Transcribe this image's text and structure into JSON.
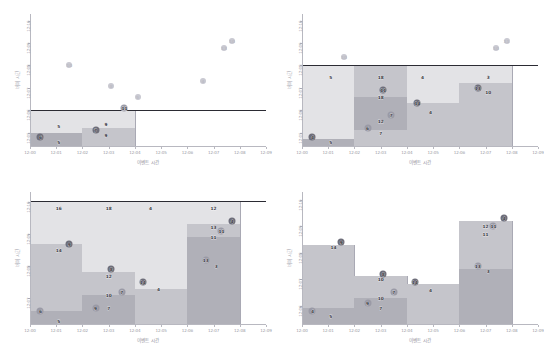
{
  "figure": {
    "width": 544,
    "height": 358,
    "background": "#ffffff",
    "layout": "2x2 grid of time-vs-time scatter/window charts"
  },
  "common": {
    "xlabel": "이벤트 시간",
    "ylabel": "버퍼 시간",
    "xticklabels": [
      "12:00",
      "12:01",
      "12:02",
      "12:03",
      "12:04",
      "12:05",
      "12:06",
      "12:07",
      "12:08",
      "12:09"
    ],
    "xlim": [
      "12:00",
      "12:09"
    ],
    "axis_color": "#b8b8c0",
    "tick_label_color": "#9a9aa4",
    "axis_label_color": "#9b9ba6",
    "watermark_color": "#2b2b33",
    "marker_dark": "#6e6e7a",
    "marker_mid": "#9a9aa6",
    "marker_light": "#c9c9d1",
    "window_light": "#e3e3e6",
    "window_mid": "#c5c5cb",
    "window_dark": "#b0b0b8"
  },
  "chart_data": [
    {
      "id": "top-left",
      "type": "scatter",
      "title": "",
      "xlabel": "이벤트 시간",
      "ylabel": "버퍼 시간",
      "xticklabels": [
        "12:00",
        "12:01",
        "12:02",
        "12:03",
        "12:04",
        "12:05",
        "12:06",
        "12:07",
        "12:08",
        "12:09"
      ],
      "yticklabels": [
        "12:05",
        "12:06",
        "12:07",
        "12:08",
        "12:09",
        "12:10"
      ],
      "ylim": [
        "12:04.4",
        "12:10.3"
      ],
      "grid": false,
      "legend": false,
      "watermark": {
        "y": "12:06",
        "label": "",
        "color": "#2b2b33"
      },
      "points": [
        {
          "label": "6",
          "x": "12:00.4",
          "y": "12:04.8",
          "shade": "dark"
        },
        {
          "label": "5",
          "x": "12:01.1",
          "y": "12:05.3",
          "shade": "none"
        },
        {
          "label": "10",
          "x": "12:01.5",
          "y": "12:08.0",
          "shade": "light"
        },
        {
          "label": "7",
          "x": "12:02.5",
          "y": "12:05.1",
          "shade": "dark"
        },
        {
          "label": "9",
          "x": "12:02.9",
          "y": "12:05.4",
          "shade": "none"
        },
        {
          "label": "9",
          "x": "12:02.9",
          "y": "12:04.9",
          "shade": "none"
        },
        {
          "label": "8",
          "x": "12:03.1",
          "y": "12:07.1",
          "shade": "light"
        },
        {
          "label": "11",
          "x": "12:03.6",
          "y": "12:06.1",
          "shade": "mid"
        },
        {
          "label": "5",
          "x": "12:04.1",
          "y": "12:06.6",
          "shade": "light"
        },
        {
          "label": "5",
          "x": "12:01.1",
          "y": "12:04.6",
          "shade": "none"
        },
        {
          "label": "4",
          "x": "12:06.6",
          "y": "12:07.3",
          "shade": "light"
        },
        {
          "label": "13",
          "x": "12:07.4",
          "y": "12:08.8",
          "shade": "light"
        },
        {
          "label": "10",
          "x": "12:07.7",
          "y": "12:09.1",
          "shade": "light"
        }
      ],
      "windows": [
        {
          "x0": "12:00",
          "x1": "12:02",
          "y0": "12:04.4",
          "y1": "12:06",
          "bands": [
            {
              "from": "12:05.0",
              "to": "12:06",
              "fill": "window_light"
            },
            {
              "from": "12:04.4",
              "to": "12:05.0",
              "fill": "window_dark"
            }
          ]
        },
        {
          "x0": "12:02",
          "x1": "12:04",
          "y0": "12:04.4",
          "y1": "12:06",
          "bands": [
            {
              "from": "12:05.2",
              "to": "12:06",
              "fill": "window_light"
            },
            {
              "from": "12:04.4",
              "to": "12:05.2",
              "fill": "window_mid"
            }
          ]
        }
      ]
    },
    {
      "id": "top-right",
      "type": "scatter",
      "title": "",
      "xlabel": "이벤트 시간",
      "ylabel": "버퍼 시간",
      "xticklabels": [
        "12:00",
        "12:01",
        "12:02",
        "12:03",
        "12:04",
        "12:05",
        "12:06",
        "12:07",
        "12:08",
        "12:09"
      ],
      "yticklabels": [
        "12:05",
        "12:06",
        "12:07",
        "12:08",
        "12:09",
        "12:10"
      ],
      "ylim": [
        "12:04.4",
        "12:10.3"
      ],
      "grid": false,
      "legend": false,
      "watermark": {
        "y": "12:08",
        "label": "",
        "color": "#2b2b33"
      },
      "points": [
        {
          "label": "4",
          "x": "12:00.4",
          "y": "12:04.8",
          "shade": "dark"
        },
        {
          "label": "5",
          "x": "12:01.1",
          "y": "12:04.6",
          "shade": "none"
        },
        {
          "label": "5",
          "x": "12:01.1",
          "y": "12:07.5",
          "shade": "none"
        },
        {
          "label": "10",
          "x": "12:01.6",
          "y": "12:08.4",
          "shade": "light"
        },
        {
          "label": "18",
          "x": "12:03.0",
          "y": "12:07.5",
          "shade": "none"
        },
        {
          "label": "11",
          "x": "12:03.1",
          "y": "12:06.9",
          "shade": "dark"
        },
        {
          "label": "18",
          "x": "12:03.0",
          "y": "12:06.6",
          "shade": "none"
        },
        {
          "label": "12",
          "x": "12:03.0",
          "y": "12:05.5",
          "shade": "none"
        },
        {
          "label": "7",
          "x": "12:03.4",
          "y": "12:05.8",
          "shade": "mid"
        },
        {
          "label": "7",
          "x": "12:03.0",
          "y": "12:05.0",
          "shade": "none"
        },
        {
          "label": "6",
          "x": "12:02.5",
          "y": "12:05.2",
          "shade": "mid"
        },
        {
          "label": "4",
          "x": "12:04.6",
          "y": "12:07.5",
          "shade": "none"
        },
        {
          "label": "14",
          "x": "12:04.4",
          "y": "12:06.3",
          "shade": "dark"
        },
        {
          "label": "4",
          "x": "12:04.9",
          "y": "12:05.9",
          "shade": "none"
        },
        {
          "label": "3",
          "x": "12:07.1",
          "y": "12:07.5",
          "shade": "none"
        },
        {
          "label": "13",
          "x": "12:06.7",
          "y": "12:07.0",
          "shade": "dark"
        },
        {
          "label": "10",
          "x": "12:07.1",
          "y": "12:06.8",
          "shade": "none"
        },
        {
          "label": "10",
          "x": "12:07.4",
          "y": "12:08.8",
          "shade": "light"
        },
        {
          "label": "11",
          "x": "12:07.8",
          "y": "12:09.1",
          "shade": "light"
        }
      ],
      "windows": [
        {
          "x0": "12:00",
          "x1": "12:02",
          "y0": "12:04.4",
          "y1": "12:08",
          "bands": [
            {
              "from": "12:04.7",
              "to": "12:08",
              "fill": "window_light"
            },
            {
              "from": "12:04.4",
              "to": "12:04.7",
              "fill": "window_dark"
            }
          ]
        },
        {
          "x0": "12:02",
          "x1": "12:04",
          "y0": "12:04.4",
          "y1": "12:08",
          "bands": [
            {
              "from": "12:06.6",
              "to": "12:08",
              "fill": "window_mid"
            },
            {
              "from": "12:05.1",
              "to": "12:06.6",
              "fill": "window_dark"
            },
            {
              "from": "12:04.4",
              "to": "12:05.1",
              "fill": "window_mid"
            }
          ]
        },
        {
          "x0": "12:04",
          "x1": "12:06",
          "y0": "12:04.4",
          "y1": "12:08",
          "bands": [
            {
              "from": "12:06.3",
              "to": "12:08",
              "fill": "window_light"
            },
            {
              "from": "12:04.4",
              "to": "12:06.3",
              "fill": "window_mid"
            }
          ]
        },
        {
          "x0": "12:06",
          "x1": "12:08",
          "y0": "12:04.4",
          "y1": "12:08",
          "bands": [
            {
              "from": "12:07.2",
              "to": "12:08",
              "fill": "window_light"
            },
            {
              "from": "12:04.4",
              "to": "12:07.2",
              "fill": "window_mid"
            }
          ]
        }
      ]
    },
    {
      "id": "bottom-left",
      "type": "scatter",
      "title": "",
      "xlabel": "이벤트 시간",
      "ylabel": "버퍼 시간",
      "xticklabels": [
        "12:00",
        "12:01",
        "12:02",
        "12:03",
        "12:04",
        "12:05",
        "12:06",
        "12:07",
        "12:08",
        "12:09"
      ],
      "yticklabels": [
        "12:07",
        "12:08",
        "12:09",
        "12:10"
      ],
      "ylim": [
        "12:06.2",
        "12:10.3"
      ],
      "grid": false,
      "legend": false,
      "watermark": {
        "y": "12:10",
        "label": "",
        "color": "#2b2b33"
      },
      "points": [
        {
          "label": "6",
          "x": "12:00.4",
          "y": "12:06.6",
          "shade": "mid"
        },
        {
          "label": "5",
          "x": "12:01.1",
          "y": "12:06.3",
          "shade": "none"
        },
        {
          "label": "16",
          "x": "12:01.1",
          "y": "12:09.8",
          "shade": "none"
        },
        {
          "label": "14",
          "x": "12:01.1",
          "y": "12:08.5",
          "shade": "none"
        },
        {
          "label": "9",
          "x": "12:01.5",
          "y": "12:08.7",
          "shade": "dark"
        },
        {
          "label": "18",
          "x": "12:03.0",
          "y": "12:09.8",
          "shade": "none"
        },
        {
          "label": "8",
          "x": "12:03.1",
          "y": "12:07.9",
          "shade": "dark"
        },
        {
          "label": "12",
          "x": "12:03.0",
          "y": "12:07.7",
          "shade": "none"
        },
        {
          "label": "10",
          "x": "12:03.0",
          "y": "12:07.1",
          "shade": "none"
        },
        {
          "label": "7",
          "x": "12:03.0",
          "y": "12:06.7",
          "shade": "none"
        },
        {
          "label": "9",
          "x": "12:02.5",
          "y": "12:06.7",
          "shade": "mid"
        },
        {
          "label": "7",
          "x": "12:03.5",
          "y": "12:07.2",
          "shade": "mid"
        },
        {
          "label": "4",
          "x": "12:04.6",
          "y": "12:09.8",
          "shade": "none"
        },
        {
          "label": "14",
          "x": "12:04.3",
          "y": "12:07.5",
          "shade": "dark"
        },
        {
          "label": "4",
          "x": "12:04.9",
          "y": "12:07.3",
          "shade": "none"
        },
        {
          "label": "12",
          "x": "12:07.0",
          "y": "12:09.8",
          "shade": "none"
        },
        {
          "label": "13",
          "x": "12:07.0",
          "y": "12:09.2",
          "shade": "none"
        },
        {
          "label": "11",
          "x": "12:07.0",
          "y": "12:08.9",
          "shade": "none"
        },
        {
          "label": "11",
          "x": "12:07.3",
          "y": "12:09.1",
          "shade": "mid"
        },
        {
          "label": "4",
          "x": "12:07.7",
          "y": "12:09.4",
          "shade": "dark"
        },
        {
          "label": "3",
          "x": "12:07.1",
          "y": "12:08.0",
          "shade": "none"
        },
        {
          "label": "13",
          "x": "12:06.7",
          "y": "12:08.2",
          "shade": "mid"
        }
      ],
      "windows": [
        {
          "x0": "12:00",
          "x1": "12:02",
          "y0": "12:06.2",
          "y1": "12:10",
          "bands": [
            {
              "from": "12:08.7",
              "to": "12:10",
              "fill": "window_light"
            },
            {
              "from": "12:06.6",
              "to": "12:08.7",
              "fill": "window_mid"
            },
            {
              "from": "12:06.2",
              "to": "12:06.6",
              "fill": "window_dark"
            }
          ]
        },
        {
          "x0": "12:02",
          "x1": "12:04",
          "y0": "12:06.2",
          "y1": "12:10",
          "bands": [
            {
              "from": "12:07.8",
              "to": "12:10",
              "fill": "window_light"
            },
            {
              "from": "12:07.1",
              "to": "12:07.8",
              "fill": "window_mid"
            },
            {
              "from": "12:06.2",
              "to": "12:07.1",
              "fill": "window_dark"
            }
          ]
        },
        {
          "x0": "12:04",
          "x1": "12:06",
          "y0": "12:06.2",
          "y1": "12:10",
          "bands": [
            {
              "from": "12:07.3",
              "to": "12:10",
              "fill": "window_light"
            },
            {
              "from": "12:06.2",
              "to": "12:07.3",
              "fill": "window_mid"
            }
          ]
        },
        {
          "x0": "12:06",
          "x1": "12:08",
          "y0": "12:06.2",
          "y1": "12:10",
          "bands": [
            {
              "from": "12:09.3",
              "to": "12:10",
              "fill": "window_light"
            },
            {
              "from": "12:08.9",
              "to": "12:09.3",
              "fill": "window_mid"
            },
            {
              "from": "12:06.2",
              "to": "12:08.9",
              "fill": "window_dark"
            }
          ]
        }
      ]
    },
    {
      "id": "bottom-right",
      "type": "scatter",
      "title": "",
      "xlabel": "이벤트 시간",
      "ylabel": "버퍼 시간",
      "xticklabels": [
        "12:00",
        "12:01",
        "12:02",
        "12:03",
        "12:04",
        "12:05",
        "12:06",
        "12:07",
        "12:08",
        "12:09"
      ],
      "yticklabels": [
        "12:06",
        "12:07",
        "12:08",
        "12:09",
        "12:10"
      ],
      "ylim": [
        "12:05.3",
        "12:10.3"
      ],
      "grid": false,
      "legend": false,
      "watermark": null,
      "points": [
        {
          "label": "4",
          "x": "12:00.4",
          "y": "12:05.8",
          "shade": "mid"
        },
        {
          "label": "5",
          "x": "12:01.1",
          "y": "12:05.6",
          "shade": "none"
        },
        {
          "label": "14",
          "x": "12:01.2",
          "y": "12:08.2",
          "shade": "none"
        },
        {
          "label": "9",
          "x": "12:01.5",
          "y": "12:08.4",
          "shade": "dark"
        },
        {
          "label": "9",
          "x": "12:02.5",
          "y": "12:06.1",
          "shade": "mid"
        },
        {
          "label": "8",
          "x": "12:03.1",
          "y": "12:07.2",
          "shade": "dark"
        },
        {
          "label": "10",
          "x": "12:03.0",
          "y": "12:07.0",
          "shade": "none"
        },
        {
          "label": "10",
          "x": "12:03.0",
          "y": "12:06.3",
          "shade": "none"
        },
        {
          "label": "7",
          "x": "12:03.0",
          "y": "12:05.9",
          "shade": "none"
        },
        {
          "label": "7",
          "x": "12:03.5",
          "y": "12:06.5",
          "shade": "mid"
        },
        {
          "label": "14",
          "x": "12:04.3",
          "y": "12:06.9",
          "shade": "dark"
        },
        {
          "label": "4",
          "x": "12:04.9",
          "y": "12:06.6",
          "shade": "none"
        },
        {
          "label": "13",
          "x": "12:06.7",
          "y": "12:07.5",
          "shade": "mid"
        },
        {
          "label": "3",
          "x": "12:07.1",
          "y": "12:07.3",
          "shade": "none"
        },
        {
          "label": "12",
          "x": "12:07.0",
          "y": "12:09.0",
          "shade": "none"
        },
        {
          "label": "11",
          "x": "12:07.3",
          "y": "12:09.0",
          "shade": "mid"
        },
        {
          "label": "11",
          "x": "12:07.0",
          "y": "12:08.7",
          "shade": "none"
        },
        {
          "label": "4",
          "x": "12:07.7",
          "y": "12:09.3",
          "shade": "dark"
        }
      ],
      "windows": [
        {
          "x0": "12:00",
          "x1": "12:02",
          "y0": "12:05.3",
          "y1": "12:08.3",
          "bands": [
            {
              "from": "12:05.9",
              "to": "12:08.3",
              "fill": "window_mid"
            },
            {
              "from": "12:05.3",
              "to": "12:05.9",
              "fill": "window_dark"
            }
          ]
        },
        {
          "x0": "12:02",
          "x1": "12:04",
          "y0": "12:05.3",
          "y1": "12:07.1",
          "bands": [
            {
              "from": "12:06.3",
              "to": "12:07.1",
              "fill": "window_mid"
            },
            {
              "from": "12:05.3",
              "to": "12:06.3",
              "fill": "window_dark"
            }
          ]
        },
        {
          "x0": "12:04",
          "x1": "12:06",
          "y0": "12:05.3",
          "y1": "12:06.8",
          "bands": [
            {
              "from": "12:05.3",
              "to": "12:06.8",
              "fill": "window_mid"
            }
          ]
        },
        {
          "x0": "12:06",
          "x1": "12:08",
          "y0": "12:05.3",
          "y1": "12:09.2",
          "bands": [
            {
              "from": "12:09.0",
              "to": "12:09.2",
              "fill": "window_mid"
            },
            {
              "from": "12:07.4",
              "to": "12:09.0",
              "fill": "window_mid"
            },
            {
              "from": "12:05.3",
              "to": "12:07.4",
              "fill": "window_dark"
            }
          ]
        }
      ]
    }
  ]
}
